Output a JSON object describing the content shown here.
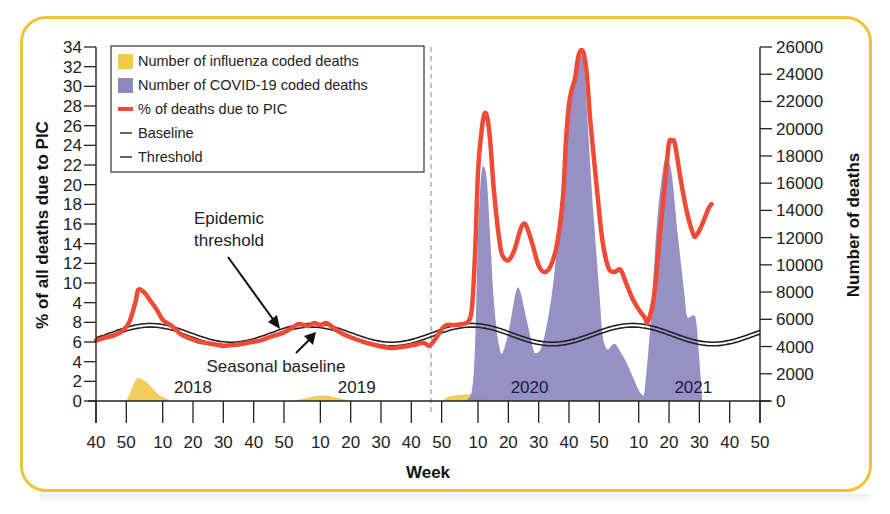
{
  "chart_data": {
    "type": "line",
    "title": "",
    "xlabel": "Week",
    "ylabel_left": "% of all deaths due to PIC",
    "ylabel_right": "Number of deaths",
    "left_axis": {
      "range": [
        0,
        34
      ],
      "tick_labels": [
        "0",
        "2",
        "4",
        "6",
        "8",
        "4",
        "10",
        "12",
        "14",
        "16",
        "18",
        "20",
        "22",
        "24",
        "26",
        "28",
        "30",
        "32",
        "34"
      ]
    },
    "right_axis": {
      "range": [
        0,
        26000
      ],
      "tick_labels": [
        "0",
        "2000",
        "4000",
        "6000",
        "8000",
        "10000",
        "12000",
        "14000",
        "16000",
        "18000",
        "20000",
        "22000",
        "24000",
        "26000"
      ]
    },
    "x_axis": {
      "index_note": "week index t: 0 = week 40 of first season",
      "ticks": [
        {
          "t": 0,
          "label": "40"
        },
        {
          "t": 10,
          "label": "50"
        },
        {
          "t": 22,
          "label": "10"
        },
        {
          "t": 32,
          "label": "20"
        },
        {
          "t": 42,
          "label": "30"
        },
        {
          "t": 52,
          "label": "40"
        },
        {
          "t": 62,
          "label": "50"
        },
        {
          "t": 74,
          "label": "10"
        },
        {
          "t": 84,
          "label": "20"
        },
        {
          "t": 94,
          "label": "30"
        },
        {
          "t": 104,
          "label": "40"
        },
        {
          "t": 114,
          "label": "50"
        },
        {
          "t": 126,
          "label": "10"
        },
        {
          "t": 136,
          "label": "20"
        },
        {
          "t": 146,
          "label": "30"
        },
        {
          "t": 156,
          "label": "40"
        },
        {
          "t": 166,
          "label": "50"
        },
        {
          "t": 179,
          "label": "10"
        },
        {
          "t": 189,
          "label": "20"
        },
        {
          "t": 199,
          "label": "30"
        },
        {
          "t": 209,
          "label": "40"
        },
        {
          "t": 219,
          "label": "50"
        }
      ],
      "range": [
        0,
        219
      ],
      "dashed_divider_t": 110.5
    },
    "year_labels": [
      {
        "t": 32,
        "label": "2018"
      },
      {
        "t": 86,
        "label": "2019"
      },
      {
        "t": 143,
        "label": "2020"
      },
      {
        "t": 197,
        "label": "2021"
      }
    ],
    "series": [
      {
        "name": "% of deaths due to PIC",
        "axis": "left",
        "color": "#ee4a36",
        "points": [
          [
            0,
            5.8
          ],
          [
            3,
            6.1
          ],
          [
            6,
            6.3
          ],
          [
            9,
            6.8
          ],
          [
            11,
            7.6
          ],
          [
            13,
            9.5
          ],
          [
            14,
            10.7
          ],
          [
            16,
            10.4
          ],
          [
            18,
            9.6
          ],
          [
            20,
            8.8
          ],
          [
            22,
            7.8
          ],
          [
            25,
            7.2
          ],
          [
            28,
            6.4
          ],
          [
            31,
            6.0
          ],
          [
            34,
            5.7
          ],
          [
            38,
            5.5
          ],
          [
            42,
            5.3
          ],
          [
            46,
            5.4
          ],
          [
            50,
            5.6
          ],
          [
            54,
            5.8
          ],
          [
            58,
            6.2
          ],
          [
            62,
            6.6
          ],
          [
            65,
            7.1
          ],
          [
            67,
            7.4
          ],
          [
            70,
            7.2
          ],
          [
            72,
            7.5
          ],
          [
            74,
            7.3
          ],
          [
            76,
            7.5
          ],
          [
            78,
            7.1
          ],
          [
            81,
            6.5
          ],
          [
            85,
            6.0
          ],
          [
            89,
            5.6
          ],
          [
            93,
            5.3
          ],
          [
            97,
            5.1
          ],
          [
            101,
            5.2
          ],
          [
            105,
            5.4
          ],
          [
            108,
            5.6
          ],
          [
            110,
            5.3
          ],
          [
            112,
            6.0
          ],
          [
            115,
            7.2
          ],
          [
            118,
            7.3
          ],
          [
            121,
            7.4
          ],
          [
            123,
            7.7
          ],
          [
            124,
            9.0
          ],
          [
            125,
            14.0
          ],
          [
            126,
            22.0
          ],
          [
            127,
            25.5
          ],
          [
            128,
            27.5
          ],
          [
            129,
            27.3
          ],
          [
            130,
            25.0
          ],
          [
            131,
            21.0
          ],
          [
            132,
            18.0
          ],
          [
            133,
            15.5
          ],
          [
            134,
            14.0
          ],
          [
            136,
            13.5
          ],
          [
            138,
            14.5
          ],
          [
            140,
            16.5
          ],
          [
            141,
            17.0
          ],
          [
            142,
            16.8
          ],
          [
            144,
            15.0
          ],
          [
            146,
            13.0
          ],
          [
            148,
            12.4
          ],
          [
            150,
            13.0
          ],
          [
            152,
            15.0
          ],
          [
            154,
            19.5
          ],
          [
            155,
            25.0
          ],
          [
            156,
            28.5
          ],
          [
            157,
            30.0
          ],
          [
            158,
            31.0
          ],
          [
            159,
            33.0
          ],
          [
            160,
            33.7
          ],
          [
            161,
            33.2
          ],
          [
            162,
            31.0
          ],
          [
            163,
            27.0
          ],
          [
            165,
            21.0
          ],
          [
            167,
            15.5
          ],
          [
            169,
            12.8
          ],
          [
            171,
            12.4
          ],
          [
            173,
            12.6
          ],
          [
            175,
            11.2
          ],
          [
            177,
            9.8
          ],
          [
            179,
            8.8
          ],
          [
            181,
            8.0
          ],
          [
            182,
            7.6
          ],
          [
            184,
            10.0
          ],
          [
            186,
            16.0
          ],
          [
            188,
            22.0
          ],
          [
            189,
            24.8
          ],
          [
            190,
            25.0
          ],
          [
            191,
            24.6
          ],
          [
            193,
            21.0
          ],
          [
            195,
            18.0
          ],
          [
            197,
            16.0
          ],
          [
            198,
            15.9
          ],
          [
            200,
            17.0
          ],
          [
            202,
            18.5
          ],
          [
            203,
            18.9
          ]
        ]
      },
      {
        "name": "Number of COVID-19 coded deaths",
        "axis": "right",
        "color": "#8d87c0",
        "points": [
          [
            122,
            0
          ],
          [
            124,
            800
          ],
          [
            125,
            4000
          ],
          [
            126,
            12000
          ],
          [
            127,
            16500
          ],
          [
            128,
            17200
          ],
          [
            129,
            16000
          ],
          [
            130,
            12000
          ],
          [
            131,
            8000
          ],
          [
            132,
            5500
          ],
          [
            133,
            4000
          ],
          [
            134,
            3500
          ],
          [
            136,
            5000
          ],
          [
            138,
            7500
          ],
          [
            139,
            8300
          ],
          [
            140,
            8000
          ],
          [
            142,
            6000
          ],
          [
            144,
            4000
          ],
          [
            145,
            3500
          ],
          [
            147,
            4000
          ],
          [
            149,
            6000
          ],
          [
            151,
            9000
          ],
          [
            153,
            14000
          ],
          [
            155,
            19000
          ],
          [
            157,
            23000
          ],
          [
            159,
            24800
          ],
          [
            160,
            25400
          ],
          [
            161,
            24500
          ],
          [
            162,
            21000
          ],
          [
            164,
            14000
          ],
          [
            166,
            8000
          ],
          [
            167,
            5000
          ],
          [
            168,
            4000
          ],
          [
            169,
            3800
          ],
          [
            171,
            4200
          ],
          [
            173,
            3600
          ],
          [
            175,
            2800
          ],
          [
            177,
            1800
          ],
          [
            179,
            800
          ],
          [
            180,
            500
          ],
          [
            181,
            900
          ],
          [
            183,
            6000
          ],
          [
            185,
            13000
          ],
          [
            187,
            17000
          ],
          [
            188,
            17800
          ],
          [
            189,
            17500
          ],
          [
            190,
            16500
          ],
          [
            192,
            12000
          ],
          [
            194,
            8000
          ],
          [
            195,
            6200
          ],
          [
            197,
            6300
          ],
          [
            198,
            5800
          ],
          [
            199,
            3000
          ],
          [
            200,
            0
          ]
        ]
      },
      {
        "name": "Number of influenza coded deaths",
        "axis": "right",
        "color": "#f2c94c",
        "points": [
          [
            10,
            0
          ],
          [
            11,
            500
          ],
          [
            12,
            1000
          ],
          [
            13,
            1500
          ],
          [
            14,
            1700
          ],
          [
            16,
            1500
          ],
          [
            18,
            1100
          ],
          [
            20,
            600
          ],
          [
            22,
            300
          ],
          [
            25,
            0
          ],
          [
            64,
            0
          ],
          [
            68,
            150
          ],
          [
            72,
            350
          ],
          [
            75,
            400
          ],
          [
            78,
            320
          ],
          [
            82,
            100
          ],
          [
            85,
            0
          ],
          [
            114,
            0
          ],
          [
            116,
            300
          ],
          [
            120,
            450
          ],
          [
            124,
            500
          ],
          [
            126,
            400
          ],
          [
            128,
            200
          ],
          [
            130,
            0
          ]
        ]
      },
      {
        "name": "Baseline",
        "axis": "left",
        "color": "#222222",
        "wave": {
          "mean": 6.2,
          "amplitude": 0.9,
          "period_weeks": 53,
          "peak_t": 18
        }
      },
      {
        "name": "Threshold",
        "axis": "left",
        "color": "#222222",
        "wave": {
          "mean": 6.55,
          "amplitude": 0.9,
          "period_weeks": 53,
          "peak_t": 18
        }
      }
    ],
    "legend": {
      "position": "upper-left",
      "entries": [
        {
          "label": "Number of influenza coded deaths",
          "swatch": "square",
          "color": "#f2c94c"
        },
        {
          "label": "Number of COVID-19 coded deaths",
          "swatch": "square",
          "color": "#8d87c0"
        },
        {
          "label": "% of deaths due to PIC",
          "swatch": "line",
          "color": "#ee4a36"
        },
        {
          "label": "Baseline",
          "swatch": "thin-line",
          "color": "#222222"
        },
        {
          "label": "Threshold",
          "swatch": "thin-line",
          "color": "#222222"
        }
      ]
    },
    "annotations": [
      {
        "text_lines": [
          "Epidemic",
          "threshold"
        ],
        "arrow_to_t": 60
      },
      {
        "text_lines": [
          "Seasonal baseline"
        ],
        "arrow_to_t": 74
      }
    ],
    "grid": false
  }
}
